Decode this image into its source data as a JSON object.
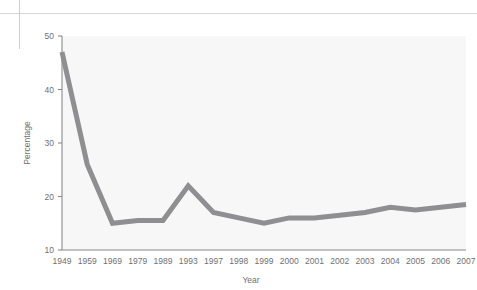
{
  "chart_data": {
    "type": "line",
    "title": "",
    "subtitle": "",
    "xlabel": "Year",
    "ylabel": "Percentage",
    "categories": [
      "1949",
      "1959",
      "1969",
      "1979",
      "1989",
      "1993",
      "1997",
      "1998",
      "1999",
      "2000",
      "2001",
      "2002",
      "2003",
      "2004",
      "2005",
      "2006",
      "2007"
    ],
    "values": [
      47,
      26,
      15,
      15.5,
      15.5,
      22,
      17,
      16,
      15,
      16,
      16,
      16.5,
      17,
      18,
      17.5,
      18,
      18.5
    ],
    "series": [
      {
        "name": "Percentage",
        "values": [
          47,
          26,
          15,
          15.5,
          15.5,
          22,
          17,
          16,
          15,
          16,
          16,
          16.5,
          17,
          18,
          17.5,
          18,
          18.5
        ],
        "color": "#8f8f91"
      }
    ],
    "x_tick_labels": [
      "1949",
      "1959",
      "1969",
      "1979",
      "1989",
      "1993",
      "1997",
      "1998",
      "1999",
      "2000",
      "2001",
      "2002",
      "2003",
      "2004",
      "2005",
      "2006",
      "2007"
    ],
    "y_tick_labels": [
      "10",
      "20",
      "30",
      "40",
      "50"
    ],
    "y_ticks": [
      10,
      20,
      30,
      40,
      50
    ],
    "ylim": [
      10,
      50
    ],
    "xlim_index": [
      0,
      16
    ],
    "grid": false,
    "legend": false,
    "legend_position": "none",
    "plot_background": "#f7f7f8",
    "axis_color": "#8a8a8c",
    "line_color": "#8f8f91",
    "line_width": 5,
    "markers": false
  },
  "figure": {
    "y_axis_title": "Percentage",
    "x_axis_title": "Year"
  }
}
